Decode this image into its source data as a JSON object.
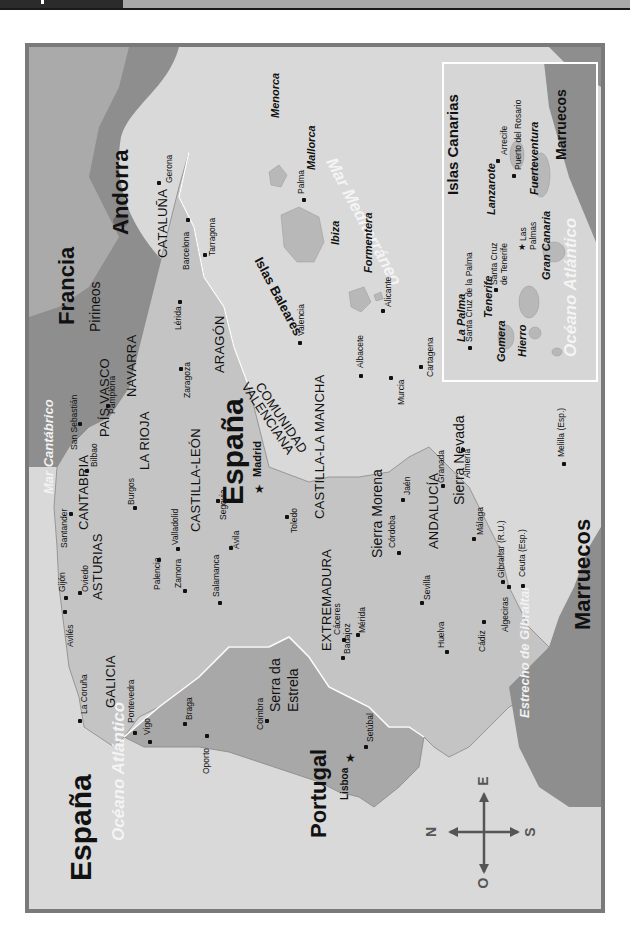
{
  "map": {
    "title": "España",
    "orientation": "rotated 90° counter-clockwise",
    "colors": {
      "sea": "#d9d9d9",
      "spain_land": "#c4c4c4",
      "portugal_land": "#a8a8a8",
      "foreign_land": "#8e8e8e",
      "frame": "#7a7a7a",
      "border_line": "#ffffff"
    },
    "countries": {
      "title": "España",
      "spain": "España",
      "portugal": "Portugal",
      "france": "Francia",
      "andorra": "Andorra",
      "morocco": "Marruecos",
      "morocco_inset": "Marruecos"
    },
    "water": {
      "atlantic": "Océano Atlántico",
      "atlantic_inset": "Océano Atlántico",
      "mediterranean": "Mar Mediterráneo",
      "cantabrian": "Mar Cantábrico",
      "gibraltar_strait": "Estrecho de Gibraltar"
    },
    "mountains": {
      "pyrenees": "Pirineos",
      "sierra_morena": "Sierra Morena",
      "sierra_nevada": "Sierra Nevada",
      "serra_estrela_1": "Serra da",
      "serra_estrela_2": "Estrela"
    },
    "regions": {
      "cataluna": "CATALUÑA",
      "aragon": "ARAGÓN",
      "navarra": "NAVARRA",
      "pais_vasco": "PAÍS VASCO",
      "la_rioja": "LA RIOJA",
      "cantabria": "CANTABRIA",
      "asturias": "ASTURIAS",
      "galicia": "GALICIA",
      "castilla_leon": "CASTILLA-LEÓN",
      "castilla_la_mancha": "CASTILLA-LA MANCHA",
      "comunidad": "COMUNIDAD",
      "valenciana": "VALENCIANA",
      "extremadura": "EXTREMADURA",
      "andalucia": "ANDALUCÍA"
    },
    "cities": {
      "gerona": "Gerona",
      "barcelona": "Barcelona",
      "tarragona": "Tarragona",
      "lerida": "Lérida",
      "zaragoza": "Zaragoza",
      "pamplona": "Pamplona",
      "san_sebastian": "San Sebastián",
      "bilbao": "Bilbao",
      "santander": "Santander",
      "burgos": "Burgos",
      "oviedo": "Oviedo",
      "gijon": "Gijón",
      "aviles": "Avilés",
      "la_coruna": "La Coruña",
      "pontevedra": "Pontevedra",
      "vigo": "Vigo",
      "palencia": "Palencia",
      "valladolid": "Valladolid",
      "zamora": "Zamora",
      "salamanca": "Salamanca",
      "segovia": "Segovia",
      "avila": "Ávila",
      "madrid": "Madrid",
      "toledo": "Toledo",
      "valencia": "Valencia",
      "alicante": "Alicante",
      "albacete": "Albacete",
      "murcia": "Murcia",
      "cartagena": "Cartagena",
      "caceres": "Cáceres",
      "merida": "Mérida",
      "badajoz": "Badajoz",
      "cordoba": "Córdoba",
      "jaen": "Jaén",
      "granada": "Granada",
      "almeria": "Almería",
      "sevilla": "Sevilla",
      "huelva": "Huelva",
      "cadiz": "Cádiz",
      "malaga": "Málaga",
      "algeciras": "Algeciras",
      "gibraltar": "Gibraltar (R.U.)",
      "ceuta": "Ceuta (Esp.)",
      "melilla": "Melilla (Esp.)",
      "braga": "Braga",
      "oporto": "Oporto",
      "coimbra": "Coimbra",
      "lisboa": "Lisboa",
      "setubal": "Setúbal",
      "palma": "Palma"
    },
    "baleares": {
      "group": "Islas Baleares",
      "menorca": "Menorca",
      "mallorca": "Mallorca",
      "ibiza": "Ibiza",
      "formentera": "Formentera"
    },
    "canarias": {
      "title": "Islas Canarias",
      "la_palma": "La Palma",
      "santa_cruz_palma": "Santa Cruz de la Palma",
      "tenerife": "Tenerife",
      "santa_cruz_tenerife_1": "Santa Cruz",
      "santa_cruz_tenerife_2": "de Tenerife",
      "gomera": "Gomera",
      "hierro": "Hierro",
      "gran_canaria": "Gran Canaria",
      "las_palmas_1": "Las",
      "las_palmas_2": "Palmas",
      "lanzarote": "Lanzarote",
      "arrecife": "Arrecife",
      "fuerteventura": "Fuerteventura",
      "puerto_rosario": "Puerto del Rosario"
    },
    "compass": {
      "north": "N",
      "south": "S",
      "east": "E",
      "west": "O"
    }
  }
}
